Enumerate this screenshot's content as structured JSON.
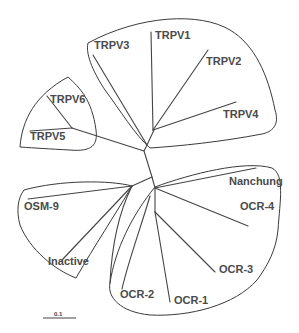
{
  "diagram": {
    "type": "unrooted phylogenetic tree",
    "groups": [
      {
        "name": "TRPV1-4 clade",
        "members": [
          "TRPV1",
          "TRPV2",
          "TRPV3",
          "TRPV4"
        ]
      },
      {
        "name": "TRPV5-6 clade",
        "members": [
          "TRPV5",
          "TRPV6"
        ]
      },
      {
        "name": "OSM-9 clade",
        "members": [
          "OSM-9",
          "Inactive"
        ]
      },
      {
        "name": "OCR clade",
        "members": [
          "Nanchung",
          "OCR-4",
          "OCR-3",
          "OCR-1",
          "OCR-2"
        ]
      }
    ],
    "labels": {
      "trpv1": "TRPV1",
      "trpv2": "TRPV2",
      "trpv3": "TRPV3",
      "trpv4": "TRPV4",
      "trpv5": "TRPV5",
      "trpv6": "TRPV6",
      "osm9": "OSM-9",
      "inactive": "Inactive",
      "nanchung": "Nanchung",
      "ocr4": "OCR-4",
      "ocr3": "OCR-3",
      "ocr2": "OCR-2",
      "ocr1": "OCR-1"
    },
    "scale_bar": {
      "label": "0.1"
    },
    "colors": {
      "line": "#444444",
      "text": "#4a4a4a",
      "background": "#ffffff"
    }
  }
}
